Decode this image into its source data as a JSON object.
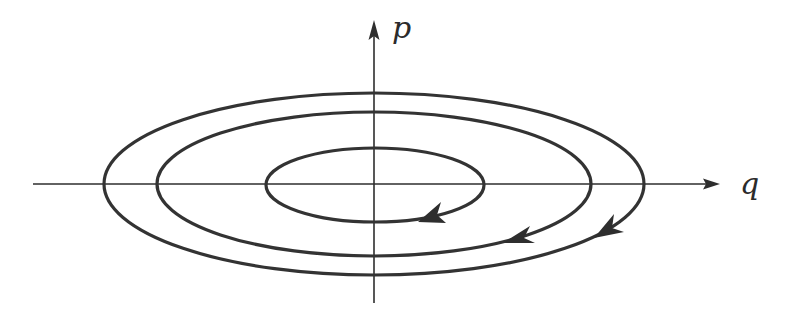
{
  "figure": {
    "type": "phase-space-diagram",
    "axes": {
      "horizontal": {
        "label": "q"
      },
      "vertical": {
        "label": "p"
      }
    },
    "origin": {
      "x": 374,
      "y": 184
    },
    "orbits": [
      {
        "name": "inner",
        "rx": 110,
        "ry": 37,
        "direction": "clockwise",
        "arrow_at": {
          "x": 430,
          "y": 216
        }
      },
      {
        "name": "middle",
        "rx": 217,
        "ry": 72,
        "direction": "clockwise",
        "arrow_at": {
          "x": 516,
          "y": 238
        }
      },
      {
        "name": "outer",
        "rx": 270,
        "ry": 91,
        "direction": "clockwise",
        "arrow_at": {
          "x": 608,
          "y": 230
        }
      }
    ],
    "colors": {
      "stroke": "#333333",
      "background": "#ffffff"
    }
  }
}
